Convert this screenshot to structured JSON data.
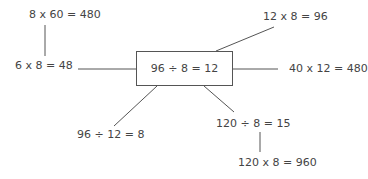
{
  "diagram": {
    "center": "96 ÷ 8 = 12",
    "nodes": [
      {
        "id": "top-left",
        "text": "8 x 60 = 480"
      },
      {
        "id": "left",
        "text": "6 x 8 = 48"
      },
      {
        "id": "top-right",
        "text": "12 x 8 = 96"
      },
      {
        "id": "right",
        "text": "40 x 12 = 480"
      },
      {
        "id": "bottom-left",
        "text": "96 ÷ 12 = 8"
      },
      {
        "id": "bottom-right",
        "text": "120 ÷ 8 = 15"
      },
      {
        "id": "bottom-right-child",
        "text": "120 x 8 = 960"
      }
    ],
    "line_color": "#555555"
  }
}
